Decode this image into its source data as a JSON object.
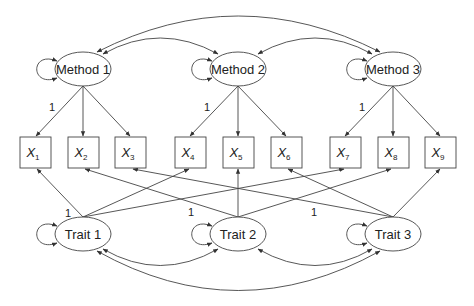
{
  "diagram": {
    "type": "MTMM confirmatory factor analysis (path diagram)",
    "methods": [
      {
        "label": "Method 1",
        "cx": 83,
        "cy": 69
      },
      {
        "label": "Method 2",
        "cx": 238,
        "cy": 69
      },
      {
        "label": "Method 3",
        "cx": 393,
        "cy": 69
      }
    ],
    "traits": [
      {
        "label": "Trait 1",
        "cx": 83,
        "cy": 234
      },
      {
        "label": "Trait 2",
        "cx": 238,
        "cy": 234
      },
      {
        "label": "Trait 3",
        "cx": 393,
        "cy": 234
      }
    ],
    "indicators": [
      {
        "var": "X",
        "sub": "1",
        "cx": 35
      },
      {
        "var": "X",
        "sub": "2",
        "cx": 83
      },
      {
        "var": "X",
        "sub": "3",
        "cx": 130
      },
      {
        "var": "X",
        "sub": "4",
        "cx": 190
      },
      {
        "var": "X",
        "sub": "5",
        "cx": 238
      },
      {
        "var": "X",
        "sub": "6",
        "cx": 286
      },
      {
        "var": "X",
        "sub": "7",
        "cx": 345
      },
      {
        "var": "X",
        "sub": "8",
        "cx": 393
      },
      {
        "var": "X",
        "sub": "9",
        "cx": 440
      }
    ],
    "fixed_loading_label": "1",
    "method_loadings": [
      {
        "from": "Method 1",
        "to": [
          "X1",
          "X2",
          "X3"
        ],
        "fixed": "X1"
      },
      {
        "from": "Method 2",
        "to": [
          "X4",
          "X5",
          "X6"
        ],
        "fixed": "X4"
      },
      {
        "from": "Method 3",
        "to": [
          "X7",
          "X8",
          "X9"
        ],
        "fixed": "X7"
      }
    ],
    "trait_loadings": [
      {
        "from": "Trait 1",
        "to": [
          "X1",
          "X4",
          "X7"
        ],
        "fixed": "X1"
      },
      {
        "from": "Trait 2",
        "to": [
          "X2",
          "X5",
          "X8"
        ],
        "fixed": "X2"
      },
      {
        "from": "Trait 3",
        "to": [
          "X3",
          "X6",
          "X9"
        ],
        "fixed": "X3"
      }
    ],
    "covariances": [
      [
        "Method 1",
        "Method 2"
      ],
      [
        "Method 2",
        "Method 3"
      ],
      [
        "Method 1",
        "Method 3"
      ],
      [
        "Trait 1",
        "Trait 2"
      ],
      [
        "Trait 2",
        "Trait 3"
      ],
      [
        "Trait 1",
        "Trait 3"
      ]
    ],
    "variances": [
      "Method 1",
      "Method 2",
      "Method 3",
      "Trait 1",
      "Trait 2",
      "Trait 3"
    ],
    "colors": {
      "stroke": "#333333",
      "text": "#222222",
      "background": "#ffffff"
    }
  }
}
